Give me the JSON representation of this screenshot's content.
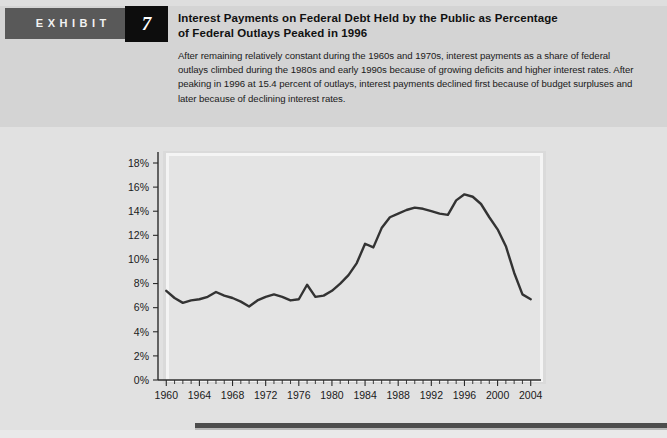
{
  "exhibit": {
    "label": "EXHIBIT",
    "number": "7"
  },
  "header": {
    "title_line1": "Interest Payments on Federal Debt Held by the Public as Percentage",
    "title_line2": "of Federal Outlays Peaked in 1996",
    "description": "After remaining relatively constant during the 1960s and 1970s, interest payments as a share of federal outlays climbed during the 1980s and early 1990s because of growing deficits and higher interest rates. After peaking in 1996 at 15.4 percent of outlays, interest payments declined first because of budget surpluses and later because of declining interest rates."
  },
  "colors": {
    "page_background": "#e3e3e3",
    "header_band": "#d4d4d4",
    "exhibit_bar": "#595959",
    "exhibit_number_box": "#0d0d0d",
    "plot_background": "#e4e4e4",
    "plot_border": "#f4f4f4",
    "line_color": "#333333",
    "axis_color": "#2b2b2b",
    "bottom_rule": "#4d4d4d"
  },
  "chart_data": {
    "type": "line",
    "title": "Interest Payments on Federal Debt Held by the Public as Percentage of Federal Outlays Peaked in 1996",
    "xlabel": "",
    "ylabel": "",
    "xlim": [
      1959,
      2005
    ],
    "ylim": [
      0,
      19
    ],
    "grid": false,
    "legend": "none",
    "y_ticks": [
      0,
      2,
      4,
      6,
      8,
      10,
      12,
      14,
      16,
      18
    ],
    "y_tick_labels": [
      "0%",
      "2%",
      "4%",
      "6%",
      "8%",
      "10%",
      "12%",
      "14%",
      "16%",
      "18%"
    ],
    "x_ticks": [
      1960,
      1964,
      1968,
      1972,
      1976,
      1980,
      1984,
      1988,
      1992,
      1996,
      2000,
      2004
    ],
    "x_tick_labels": [
      "1960",
      "1964",
      "1968",
      "1972",
      "1976",
      "1980",
      "1984",
      "1988",
      "1992",
      "1996",
      "2000",
      "2004"
    ],
    "x_minor_tick_step": 1,
    "series": [
      {
        "name": "Interest payments as percentage of federal outlays",
        "x": [
          1960,
          1961,
          1962,
          1963,
          1964,
          1965,
          1966,
          1967,
          1968,
          1969,
          1970,
          1971,
          1972,
          1973,
          1974,
          1975,
          1976,
          1977,
          1978,
          1979,
          1980,
          1981,
          1982,
          1983,
          1984,
          1985,
          1986,
          1987,
          1988,
          1989,
          1990,
          1991,
          1992,
          1993,
          1994,
          1995,
          1996,
          1997,
          1998,
          1999,
          2000,
          2001,
          2002,
          2003,
          2004
        ],
        "values": [
          7.4,
          6.8,
          6.4,
          6.6,
          6.7,
          6.9,
          7.3,
          7.0,
          6.8,
          6.5,
          6.1,
          6.6,
          6.9,
          7.1,
          6.9,
          6.6,
          6.7,
          7.9,
          6.9,
          7.0,
          7.4,
          8.0,
          8.7,
          9.7,
          11.3,
          11.0,
          12.6,
          13.5,
          13.8,
          14.1,
          14.3,
          14.2,
          14.0,
          13.8,
          13.7,
          14.9,
          15.4,
          15.2,
          14.6,
          13.5,
          12.5,
          11.1,
          8.9,
          7.1,
          6.7
        ]
      }
    ]
  },
  "bottom": {
    "rule": ""
  }
}
